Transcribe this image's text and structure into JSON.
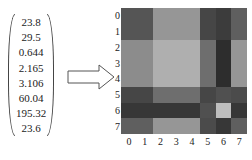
{
  "vector": {
    "values": [
      "23.8",
      "29.5",
      "0.644",
      "2.165",
      "3.106",
      "60.04",
      "195.32",
      "23.6"
    ]
  },
  "arrow": {
    "direction": "right",
    "style": "outline"
  },
  "heatmap": {
    "x_ticks": [
      "0",
      "1",
      "2",
      "3",
      "4",
      "5",
      "6",
      "7"
    ],
    "y_ticks": [
      "0",
      "1",
      "2",
      "3",
      "4",
      "5",
      "6",
      "7"
    ],
    "gray_levels": [
      [
        85,
        85,
        150,
        150,
        150,
        70,
        60,
        95
      ],
      [
        85,
        85,
        150,
        150,
        150,
        70,
        60,
        95
      ],
      [
        140,
        140,
        175,
        175,
        175,
        110,
        45,
        150
      ],
      [
        140,
        140,
        175,
        175,
        175,
        110,
        45,
        150
      ],
      [
        140,
        140,
        175,
        175,
        175,
        110,
        45,
        150
      ],
      [
        70,
        70,
        110,
        110,
        110,
        70,
        80,
        75
      ],
      [
        55,
        55,
        55,
        55,
        55,
        80,
        190,
        55
      ],
      [
        95,
        95,
        150,
        150,
        150,
        75,
        55,
        95
      ]
    ]
  }
}
